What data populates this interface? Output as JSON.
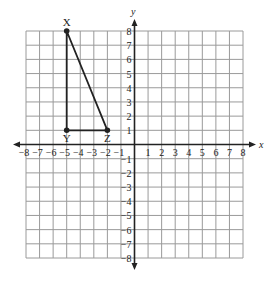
{
  "diagram": {
    "type": "coordinate-plane",
    "x_axis_label": "x",
    "y_axis_label": "y",
    "x_range": [
      -8,
      8
    ],
    "y_range": [
      -8,
      8
    ],
    "x_ticks": [
      "-8",
      "-7",
      "-6",
      "-5",
      "-4",
      "-3",
      "-2",
      "-1",
      "1",
      "2",
      "3",
      "4",
      "5",
      "6",
      "7",
      "8"
    ],
    "y_ticks": [
      "8",
      "7",
      "6",
      "5",
      "4",
      "3",
      "2",
      "1",
      "-1",
      "-2",
      "-3",
      "-4",
      "-5",
      "-6",
      "-7",
      "-8"
    ],
    "points": [
      {
        "label": "X",
        "x": -5,
        "y": 8
      },
      {
        "label": "Y",
        "x": -5,
        "y": 1
      },
      {
        "label": "Z",
        "x": -2,
        "y": 1
      }
    ],
    "polygon": [
      "X",
      "Y",
      "Z"
    ],
    "colors": {
      "grid": "#9a9a9a",
      "axis": "#222222",
      "shape": "#222222",
      "background": "#ffffff"
    }
  }
}
